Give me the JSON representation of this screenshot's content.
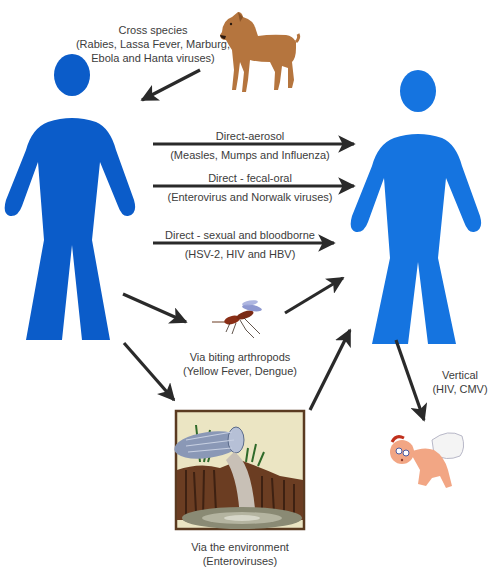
{
  "diagram": {
    "colors": {
      "source_figure": "#0b5cc9",
      "target_figure": "#1574e0",
      "arrow": "#2a2a2a",
      "text": "#3c3c3c"
    },
    "figures": {
      "source": {
        "icon": "person-icon",
        "role": "infected-host"
      },
      "target": {
        "icon": "person-icon",
        "role": "new-host"
      }
    },
    "routes": {
      "cross_species": {
        "title": "Cross species",
        "detail_line1": "(Rabies, Lassa Fever, Marburg,",
        "detail_line2": "Ebola and Hanta viruses)",
        "icon": "dog-icon"
      },
      "aerosol": {
        "title": "Direct-aerosol",
        "detail": "(Measles, Mumps  and Influenza)"
      },
      "fecal_oral": {
        "title": "Direct - fecal-oral",
        "detail": "(Enterovirus and Norwalk viruses)"
      },
      "sexual": {
        "title": "Direct - sexual and bloodborne",
        "detail": "(HSV-2, HIV and HBV)"
      },
      "arthropods": {
        "title": "Via biting arthropods",
        "detail": "(Yellow Fever, Dengue)",
        "icon": "mosquito-icon"
      },
      "environment": {
        "title": "Via the environment",
        "detail": "(Enteroviruses)",
        "icon": "sewage-pipe-icon"
      },
      "vertical": {
        "title": "Vertical",
        "detail": "(HIV, CMV)",
        "icon": "baby-icon"
      }
    }
  }
}
